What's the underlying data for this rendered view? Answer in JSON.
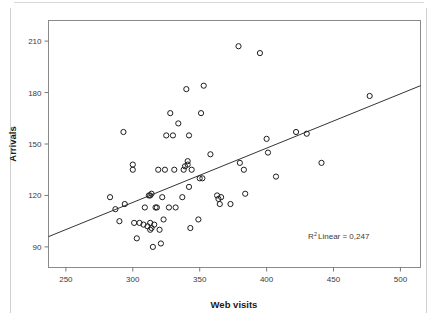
{
  "chart_data": {
    "type": "scatter",
    "title": "",
    "xlabel": "Web visits",
    "ylabel": "Arrivals",
    "xlim": [
      237,
      515
    ],
    "ylim": [
      78,
      222
    ],
    "xticks": [
      250,
      300,
      350,
      400,
      450,
      500
    ],
    "yticks": [
      90,
      120,
      150,
      180,
      210
    ],
    "xtick_labels": [
      "250",
      "300",
      "350",
      "400",
      "450",
      "500"
    ],
    "ytick_labels": [
      "90",
      "120",
      "150",
      "180",
      "210"
    ],
    "grid": false,
    "legend": "none",
    "annotation": {
      "r2_prefix": "R",
      "r2_exponent": "2",
      "r2_text": " Linear = 0,247",
      "r2_value": 0.247
    },
    "fit_line": {
      "type": "linear",
      "x_start": 237,
      "y_start": 96,
      "x_end": 515,
      "y_end": 184
    },
    "marker_style": {
      "shape": "open-circle",
      "radius": 2.6,
      "stroke": "#1d1d1d",
      "fill": "none"
    },
    "points": [
      [
        283,
        119
      ],
      [
        287,
        112
      ],
      [
        290,
        105
      ],
      [
        293,
        157
      ],
      [
        294,
        115
      ],
      [
        300,
        138
      ],
      [
        300,
        135
      ],
      [
        301,
        104
      ],
      [
        303,
        95
      ],
      [
        305,
        104
      ],
      [
        308,
        103
      ],
      [
        309,
        113
      ],
      [
        311,
        102
      ],
      [
        312,
        120
      ],
      [
        313,
        120
      ],
      [
        313,
        104
      ],
      [
        313,
        100
      ],
      [
        314,
        121
      ],
      [
        314,
        101
      ],
      [
        315,
        90
      ],
      [
        316,
        103
      ],
      [
        317,
        113
      ],
      [
        318,
        113
      ],
      [
        319,
        135
      ],
      [
        320,
        100
      ],
      [
        321,
        92
      ],
      [
        322,
        119
      ],
      [
        323,
        106
      ],
      [
        324,
        135
      ],
      [
        325,
        155
      ],
      [
        327,
        113
      ],
      [
        328,
        168
      ],
      [
        330,
        155
      ],
      [
        331,
        135
      ],
      [
        332,
        113
      ],
      [
        334,
        162
      ],
      [
        337,
        119
      ],
      [
        338,
        135
      ],
      [
        339,
        137
      ],
      [
        340,
        182
      ],
      [
        341,
        140
      ],
      [
        341,
        138
      ],
      [
        342,
        125
      ],
      [
        342,
        155
      ],
      [
        343,
        101
      ],
      [
        344,
        135
      ],
      [
        349,
        106
      ],
      [
        350,
        130
      ],
      [
        351,
        168
      ],
      [
        352,
        130
      ],
      [
        353,
        184
      ],
      [
        358,
        144
      ],
      [
        363,
        120
      ],
      [
        364,
        118
      ],
      [
        365,
        115
      ],
      [
        366,
        119
      ],
      [
        373,
        115
      ],
      [
        379,
        207
      ],
      [
        380,
        139
      ],
      [
        383,
        135
      ],
      [
        384,
        121
      ],
      [
        395,
        203
      ],
      [
        400,
        153
      ],
      [
        401,
        145
      ],
      [
        407,
        131
      ],
      [
        422,
        157
      ],
      [
        430,
        156
      ],
      [
        441,
        139
      ],
      [
        477,
        178
      ]
    ]
  }
}
